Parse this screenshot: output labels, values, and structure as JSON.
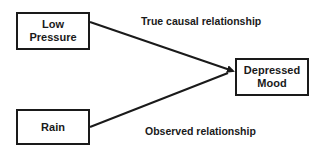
{
  "nodes": {
    "low_pressure": {
      "line1": "Low",
      "line2": "Pressure"
    },
    "rain": {
      "label": "Rain"
    },
    "depressed_mood": {
      "line1": "Depressed",
      "line2": "Mood"
    }
  },
  "edges": {
    "true_causal": {
      "label": "True causal relationship"
    },
    "observed": {
      "label": "Observed relationship"
    }
  },
  "colors": {
    "stroke": "#1a1a1a",
    "background": "#ffffff"
  }
}
